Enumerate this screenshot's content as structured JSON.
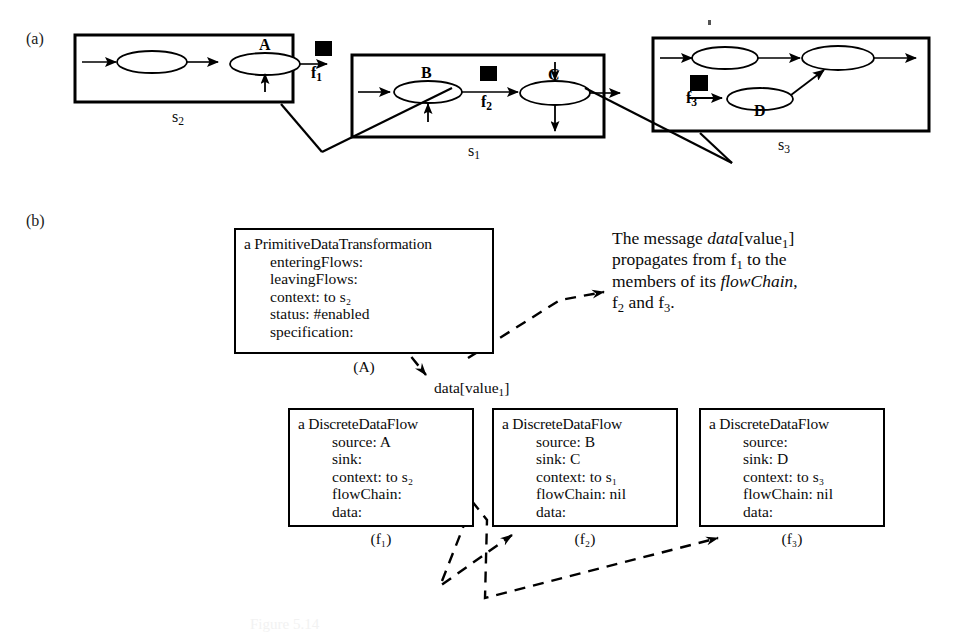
{
  "figure": {
    "part_a_label": "(a)",
    "part_b_label": "(b)",
    "bottom_caption": "Figure 5.14"
  },
  "diagram_a": {
    "states": [
      {
        "id": "s2",
        "caption": "s₂",
        "bubbles": [
          "",
          "A"
        ],
        "flow_token": "f₁"
      },
      {
        "id": "s1",
        "caption": "s₁",
        "bubbles": [
          "B",
          "C"
        ],
        "flow_token": "f₂"
      },
      {
        "id": "s3",
        "caption": "s₃",
        "bubbles": [
          "",
          "",
          "D"
        ],
        "flow_token": "f₃"
      }
    ],
    "labels": {
      "A": "A",
      "B": "B",
      "C": "C",
      "D": "D",
      "f1": "f",
      "f1_sub": "1",
      "f2": "f",
      "f2_sub": "2",
      "f3": "f",
      "f3_sub": "3",
      "s1": "s",
      "s1_sub": "1",
      "s2": "s",
      "s2_sub": "2",
      "s3": "s",
      "s3_sub": "3"
    }
  },
  "diagram_b": {
    "transformation_box": {
      "title": "a PrimitiveDataTransformation",
      "fields": [
        "enteringFlows:",
        "leavingFlows:",
        "context: to s₂",
        "status: #enabled",
        "specification:"
      ],
      "caption": "(A)"
    },
    "flow_boxes": [
      {
        "title": "a DiscreteDataFlow",
        "fields": [
          "source: A",
          "sink:",
          "context: to s₂",
          "flowChain:",
          "data:"
        ],
        "caption": "(f₁)"
      },
      {
        "title": "a DiscreteDataFlow",
        "fields": [
          "source: B",
          "sink: C",
          "context: to s₁",
          "flowChain: nil",
          "data:"
        ],
        "caption": "(f₂)"
      },
      {
        "title": "a DiscreteDataFlow",
        "fields": [
          "source:",
          "sink: D",
          "context: to s₃",
          "flowChain: nil",
          "data:"
        ],
        "caption": "(f₃)"
      }
    ],
    "message_label_plain_1": "data[value",
    "message_label_sub": "1",
    "message_label_plain_2": "]",
    "note": {
      "line1_a": "The message ",
      "line1_italic": "data",
      "line1_b": "[value",
      "line1_sub": "1",
      "line1_c": "]",
      "line2_a": "propagates from f",
      "line2_sub": "1",
      "line2_b": " to the",
      "line3_a": "members of its ",
      "line3_italic": "flowChain",
      "line3_b": ",",
      "line4_a": "f",
      "line4_sub1": "2",
      "line4_b": " and f",
      "line4_sub2": "3",
      "line4_c": "."
    }
  },
  "colors": {
    "ink": "#0b0b0b",
    "stroke": "#000000",
    "background": "#ffffff"
  }
}
